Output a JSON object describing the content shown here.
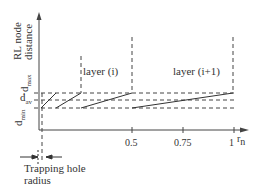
{
  "diagram": {
    "y_axis_label_line1": "RL node",
    "y_axis_label_line2": "distance",
    "x_axis_label": "r",
    "x_axis_label_sub": "n",
    "x_ticks": [
      "0.5",
      "0.75",
      "1"
    ],
    "levels": {
      "d_max": "d",
      "d_max_sub": "max",
      "d_av": "d",
      "d_av_sub": "av",
      "d_min": "d",
      "d_min_sub": "min"
    },
    "layer_labels": [
      "layer (i)",
      "layer (i+1)"
    ],
    "trapping_hole_line1": "Trapping hole",
    "trapping_hole_line2": "radius",
    "colors": {
      "line": "#333333",
      "dash": "#444444"
    }
  }
}
